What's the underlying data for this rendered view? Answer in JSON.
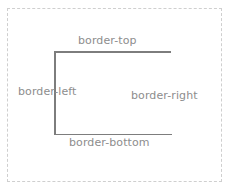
{
  "diagram": {
    "background_color": "#ffffff",
    "outer_frame": {
      "name": "outer-dashed-frame",
      "border_style": "dashed",
      "border_color": "#cfcfcf",
      "border_width_px": 1,
      "x": 7,
      "y": 8,
      "width": 215,
      "height": 174
    },
    "box": {
      "name": "bordered-box",
      "x": 54,
      "y": 51,
      "width": 118,
      "height": 84,
      "edge_color": "#7d7d7d",
      "edge_width_px": 1.5,
      "edges": [
        {
          "side": "top",
          "label": "border-top",
          "visible": true,
          "color": "#7d7d7d"
        },
        {
          "side": "left",
          "label": "border-left",
          "visible": true,
          "color": "#7d7d7d"
        },
        {
          "side": "bottom",
          "label": "border-bottom",
          "visible": true,
          "color": "#7d7d7d"
        },
        {
          "side": "right",
          "label": "border-right",
          "visible": false,
          "color": "#ffffff"
        }
      ]
    },
    "labels": {
      "top": "border-top",
      "left": "border-left",
      "right": "border-right",
      "bottom": "border-bottom",
      "text_color": "#8d8d8d",
      "font_size_px": 11
    }
  }
}
